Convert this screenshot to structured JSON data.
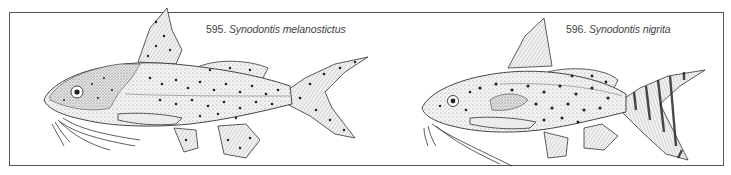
{
  "plate": {
    "frame_color": "#555555",
    "background": "#ffffff",
    "ink_color": "#2a2a2a"
  },
  "figures": [
    {
      "number": "595.",
      "species": "Synodontis melanostictus",
      "pattern": "spotted body and fins"
    },
    {
      "number": "596.",
      "species": "Synodontis nigrita",
      "pattern": "spotted body, banded caudal fin"
    }
  ]
}
